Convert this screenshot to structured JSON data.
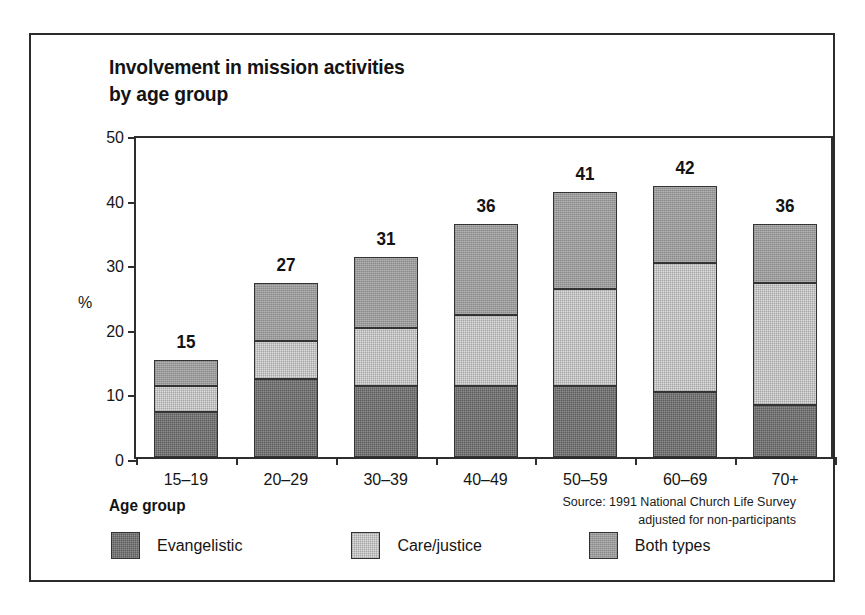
{
  "chart_data": {
    "type": "bar",
    "subtype": "stacked-vertical",
    "title": "Involvement in mission activities\nby age group",
    "xlabel": "Age group",
    "ylabel": "%",
    "ylim": [
      0,
      50
    ],
    "ytick_step": 10,
    "yticks": [
      0,
      10,
      20,
      30,
      40,
      50
    ],
    "ytick_labels": [
      "0",
      "10",
      "20",
      "30",
      "40",
      "50"
    ],
    "grid": false,
    "legend_position": "bottom-left",
    "categories": [
      "15–19",
      "20–29",
      "30–39",
      "40–49",
      "50–59",
      "60–69",
      "70+"
    ],
    "series": [
      {
        "name": "Evangelistic",
        "color": "#5c5c5c",
        "values": [
          7,
          12,
          11,
          11,
          11,
          10,
          8
        ]
      },
      {
        "name": "Care/justice",
        "color": "#dedede",
        "values": [
          4,
          6,
          9,
          11,
          15,
          20,
          19
        ]
      },
      {
        "name": "Both types",
        "color": "#9b9b9b",
        "values": [
          4,
          9,
          11,
          14,
          15,
          12,
          9
        ]
      }
    ],
    "totals": [
      15,
      27,
      31,
      36,
      41,
      42,
      36
    ],
    "total_labels": [
      "15",
      "27",
      "31",
      "36",
      "41",
      "42",
      "36"
    ],
    "annotations": {
      "source": "Source: 1991 National Church Life Survey\nadjusted for non-participants"
    }
  },
  "legend": {
    "items": [
      {
        "label": "Evangelistic",
        "swatch": "evangelistic"
      },
      {
        "label": "Care/justice",
        "swatch": "care"
      },
      {
        "label": "Both types",
        "swatch": "both"
      }
    ]
  },
  "colors": {
    "evangelistic": "#5c5c5c",
    "care_justice": "#dedede",
    "both_types": "#9b9b9b",
    "frame": "#2b2b2b",
    "text": "#141414",
    "background": "#ffffff"
  }
}
